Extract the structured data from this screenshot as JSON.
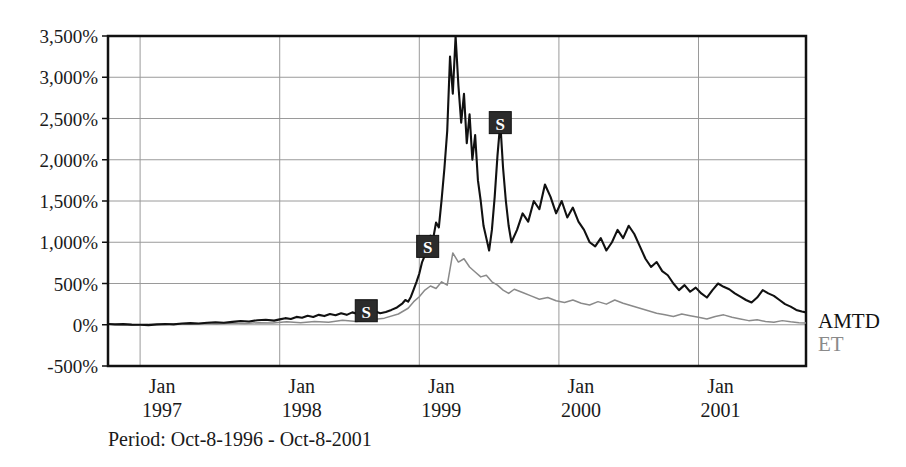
{
  "caption": "Period: Oct-8-1996 - Oct-8-2001",
  "legend": {
    "amtd_label": "AMTD",
    "et_label": "ET",
    "amtd_color": "#111111",
    "et_color": "#8a8a8a"
  },
  "markers": [
    {
      "label": "S",
      "x_value": 1998.62,
      "y_value": 170
    },
    {
      "label": "S",
      "x_value": 1999.06,
      "y_value": 950
    },
    {
      "label": "S",
      "x_value": 1999.58,
      "y_value": 2450
    }
  ],
  "chart_data": {
    "type": "line",
    "title": "",
    "subtitle": "",
    "xlabel": "",
    "ylabel": "",
    "grid": true,
    "legend_position": "right",
    "ylim": [
      -500,
      3500
    ],
    "xlim": [
      1996.77,
      2001.77
    ],
    "ytick_labels": [
      "3,500%",
      "3,000%",
      "2,500%",
      "2,000%",
      "1,500%",
      "1,000%",
      "500%",
      "0%",
      "-500%"
    ],
    "ytick_values": [
      3500,
      3000,
      2500,
      2000,
      1500,
      1000,
      500,
      0,
      -500
    ],
    "xtick_labels": [
      [
        "Jan",
        "1997"
      ],
      [
        "Jan",
        "1998"
      ],
      [
        "Jan",
        "1999"
      ],
      [
        "Jan",
        "2000"
      ],
      [
        "Jan",
        "2001"
      ]
    ],
    "xtick_values": [
      1997.0,
      1998.0,
      1999.0,
      2000.0,
      2001.0
    ],
    "series": [
      {
        "name": "AMTD",
        "color": "#111111",
        "x": [
          1996.77,
          1996.82,
          1996.88,
          1996.94,
          1997.0,
          1997.06,
          1997.12,
          1997.18,
          1997.24,
          1997.3,
          1997.36,
          1997.42,
          1997.48,
          1997.54,
          1997.6,
          1997.66,
          1997.72,
          1997.78,
          1997.84,
          1997.9,
          1997.96,
          1998.0,
          1998.04,
          1998.08,
          1998.12,
          1998.16,
          1998.2,
          1998.24,
          1998.28,
          1998.32,
          1998.36,
          1998.4,
          1998.44,
          1998.48,
          1998.52,
          1998.56,
          1998.6,
          1998.64,
          1998.68,
          1998.72,
          1998.76,
          1998.8,
          1998.84,
          1998.88,
          1998.9,
          1998.92,
          1998.94,
          1998.96,
          1998.98,
          1999.0,
          1999.02,
          1999.04,
          1999.06,
          1999.08,
          1999.1,
          1999.12,
          1999.14,
          1999.16,
          1999.18,
          1999.2,
          1999.22,
          1999.24,
          1999.26,
          1999.28,
          1999.3,
          1999.32,
          1999.34,
          1999.36,
          1999.38,
          1999.4,
          1999.42,
          1999.44,
          1999.46,
          1999.48,
          1999.5,
          1999.52,
          1999.54,
          1999.56,
          1999.58,
          1999.6,
          1999.62,
          1999.64,
          1999.66,
          1999.7,
          1999.74,
          1999.78,
          1999.82,
          1999.86,
          1999.9,
          1999.94,
          1999.98,
          2000.02,
          2000.06,
          2000.1,
          2000.14,
          2000.18,
          2000.22,
          2000.26,
          2000.3,
          2000.34,
          2000.38,
          2000.42,
          2000.46,
          2000.5,
          2000.54,
          2000.58,
          2000.62,
          2000.66,
          2000.7,
          2000.74,
          2000.78,
          2000.82,
          2000.86,
          2000.9,
          2000.94,
          2000.98,
          2001.02,
          2001.06,
          2001.1,
          2001.14,
          2001.18,
          2001.22,
          2001.26,
          2001.3,
          2001.34,
          2001.38,
          2001.42,
          2001.46,
          2001.5,
          2001.54,
          2001.58,
          2001.62,
          2001.66,
          2001.7,
          2001.74,
          2001.77
        ],
        "y": [
          10,
          5,
          8,
          2,
          0,
          -5,
          5,
          10,
          5,
          15,
          20,
          15,
          25,
          30,
          25,
          35,
          45,
          40,
          55,
          60,
          50,
          65,
          80,
          70,
          95,
          85,
          110,
          95,
          120,
          105,
          130,
          115,
          140,
          120,
          150,
          130,
          170,
          145,
          165,
          140,
          155,
          180,
          210,
          260,
          300,
          280,
          340,
          430,
          520,
          620,
          760,
          840,
          950,
          1080,
          1050,
          1240,
          1180,
          1520,
          1900,
          2350,
          3250,
          2800,
          3500,
          2900,
          2450,
          2800,
          2200,
          2550,
          2000,
          2300,
          1750,
          1500,
          1200,
          1050,
          900,
          1150,
          1550,
          2050,
          2450,
          1900,
          1500,
          1200,
          1000,
          1150,
          1350,
          1250,
          1500,
          1400,
          1700,
          1550,
          1350,
          1500,
          1300,
          1420,
          1250,
          1150,
          1000,
          950,
          1050,
          900,
          1000,
          1150,
          1050,
          1200,
          1100,
          950,
          800,
          700,
          760,
          650,
          600,
          500,
          420,
          480,
          400,
          450,
          380,
          330,
          420,
          500,
          460,
          430,
          380,
          340,
          300,
          270,
          330,
          420,
          380,
          350,
          300,
          250,
          220,
          180,
          160,
          150
        ]
      },
      {
        "name": "ET",
        "color": "#8a8a8a",
        "x": [
          1996.77,
          1996.85,
          1996.95,
          1997.05,
          1997.15,
          1997.25,
          1997.35,
          1997.45,
          1997.55,
          1997.65,
          1997.75,
          1997.85,
          1997.95,
          1998.05,
          1998.15,
          1998.25,
          1998.35,
          1998.45,
          1998.55,
          1998.65,
          1998.75,
          1998.85,
          1998.92,
          1998.96,
          1999.0,
          1999.04,
          1999.08,
          1999.12,
          1999.16,
          1999.2,
          1999.24,
          1999.28,
          1999.32,
          1999.36,
          1999.4,
          1999.44,
          1999.48,
          1999.52,
          1999.56,
          1999.6,
          1999.64,
          1999.68,
          1999.74,
          1999.8,
          1999.86,
          1999.92,
          1999.98,
          2000.04,
          2000.1,
          2000.16,
          2000.22,
          2000.28,
          2000.34,
          2000.4,
          2000.46,
          2000.52,
          2000.58,
          2000.64,
          2000.7,
          2000.76,
          2000.82,
          2000.88,
          2000.94,
          2001.0,
          2001.06,
          2001.12,
          2001.18,
          2001.24,
          2001.3,
          2001.36,
          2001.42,
          2001.48,
          2001.54,
          2001.6,
          2001.66,
          2001.72,
          2001.77
        ],
        "y": [
          5,
          0,
          -5,
          5,
          0,
          10,
          5,
          15,
          10,
          20,
          15,
          25,
          20,
          35,
          25,
          40,
          30,
          55,
          40,
          60,
          80,
          130,
          200,
          280,
          340,
          420,
          470,
          440,
          520,
          480,
          870,
          760,
          800,
          700,
          640,
          580,
          600,
          520,
          480,
          420,
          380,
          430,
          390,
          350,
          310,
          330,
          290,
          270,
          300,
          260,
          240,
          280,
          250,
          300,
          260,
          230,
          200,
          170,
          140,
          120,
          100,
          130,
          110,
          90,
          70,
          100,
          120,
          90,
          70,
          50,
          60,
          40,
          30,
          50,
          35,
          25,
          20
        ]
      }
    ]
  }
}
